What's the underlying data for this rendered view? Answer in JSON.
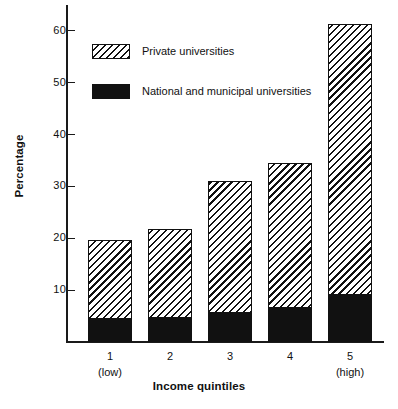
{
  "chart_data": {
    "type": "bar",
    "title": "",
    "xlabel": "Income quintiles",
    "ylabel": "Percentage",
    "categories": [
      "1",
      "2",
      "3",
      "4",
      "5"
    ],
    "category_sublabels": [
      "(low)",
      "",
      "",
      "",
      "(high)"
    ],
    "stacked": true,
    "ylim": [
      0,
      65
    ],
    "yticks": [
      10,
      20,
      30,
      40,
      50,
      60
    ],
    "ytick_labels": [
      "10",
      "20",
      "30",
      "40",
      "50",
      "60"
    ],
    "grid": false,
    "legend_position": "upper-left-inside",
    "series": [
      {
        "name": "National and municipal universities",
        "fill": "solid-black",
        "color": "#111111",
        "values": [
          4.6,
          4.8,
          5.8,
          6.7,
          9.2
        ]
      },
      {
        "name": "Private universities",
        "fill": "diagonal-hatch",
        "color": "#111111",
        "values": [
          15.0,
          17.0,
          25.2,
          27.9,
          52.1
        ]
      }
    ],
    "totals": [
      19.6,
      21.8,
      31.0,
      34.6,
      61.3
    ]
  },
  "legend": {
    "items": [
      {
        "label": "Private universities",
        "swatch": "hatch"
      },
      {
        "label": "National and municipal universities",
        "swatch": "solid"
      }
    ]
  }
}
